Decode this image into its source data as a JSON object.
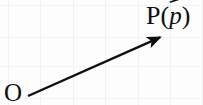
{
  "figure": {
    "type": "vector-diagram",
    "width": 203,
    "height": 105,
    "background_color": "#fdfdfd",
    "ink_color": "#100f0f",
    "grid_color": "#f2f2f4"
  },
  "labels": {
    "origin": "O",
    "point_prefix": "P(",
    "point_vector": "p",
    "point_suffix": ")",
    "point_full": "P(p⃗)"
  },
  "vector": {
    "name": "position-vector",
    "tail_x": 28,
    "tail_y": 96,
    "tip_x": 163,
    "tip_y": 36,
    "stroke_width": 2.4,
    "color": "#100f0f",
    "arrowhead": "solid-triangle"
  },
  "accent": {
    "name": "vector-accent-arrow",
    "color": "#100f0f"
  },
  "grid": {
    "vertical_x": [
      8,
      40,
      73,
      105,
      138,
      170,
      202
    ],
    "horizontal_y": [
      5,
      37,
      66,
      98
    ],
    "color": "#f1f1f3",
    "stroke_width": 1
  }
}
